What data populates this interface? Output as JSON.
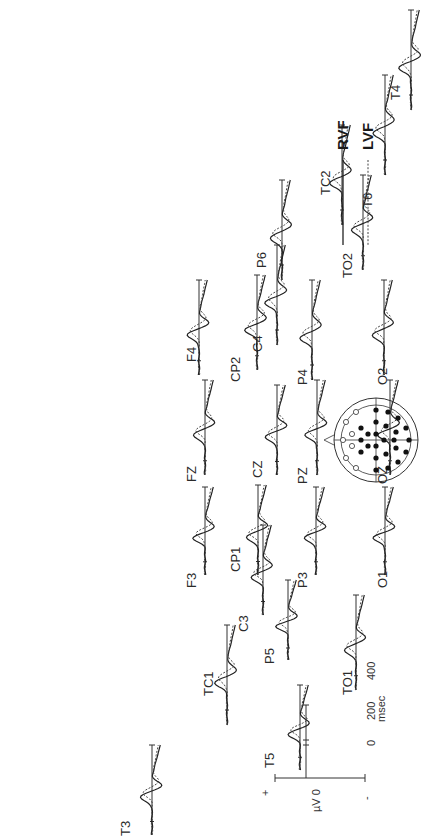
{
  "figure": {
    "orientation": "rotated 90 degrees counter-clockwise",
    "legend": {
      "items": [
        {
          "label": "RVF",
          "style": "solid"
        },
        {
          "label": "LVF",
          "style": "dotted"
        }
      ]
    },
    "scale_bar": {
      "amplitude_label": "µV 0",
      "plus_label": "+",
      "minus_label": "-",
      "time_ticks": [
        "0",
        "200",
        "400"
      ],
      "time_unit": "msec"
    },
    "head_map": {
      "nose_direction": "left",
      "filled_electrodes": "recorded (shown)",
      "open_electrodes": "not shown"
    },
    "electrodes": [
      {
        "name": "T4"
      },
      {
        "name": "TC2"
      },
      {
        "name": "T6"
      },
      {
        "name": "P6"
      },
      {
        "name": "TO2"
      },
      {
        "name": "F4"
      },
      {
        "name": "C4"
      },
      {
        "name": "CP2"
      },
      {
        "name": "P4"
      },
      {
        "name": "O2"
      },
      {
        "name": "FZ"
      },
      {
        "name": "CZ"
      },
      {
        "name": "PZ"
      },
      {
        "name": "OZ"
      },
      {
        "name": "F3"
      },
      {
        "name": "C3"
      },
      {
        "name": "CP1"
      },
      {
        "name": "P3"
      },
      {
        "name": "O1"
      },
      {
        "name": "TC1"
      },
      {
        "name": "P5"
      },
      {
        "name": "T5"
      },
      {
        "name": "TO1"
      },
      {
        "name": "T3"
      }
    ]
  },
  "chart_data": {
    "type": "line",
    "title": "",
    "xlabel": "msec",
    "ylabel": "µV",
    "x_ticks": [
      0,
      200,
      400
    ],
    "legend": [
      "RVF",
      "LVF"
    ],
    "series": [
      {
        "name": "RVF",
        "style": "solid"
      },
      {
        "name": "LVF",
        "style": "dotted"
      }
    ],
    "panels": [
      "T4",
      "TC2",
      "T6",
      "P6",
      "TO2",
      "F4",
      "C4",
      "CP2",
      "P4",
      "O2",
      "FZ",
      "CZ",
      "PZ",
      "OZ",
      "F3",
      "C3",
      "CP1",
      "P3",
      "O1",
      "TC1",
      "P5",
      "T5",
      "TO1",
      "T3"
    ]
  }
}
